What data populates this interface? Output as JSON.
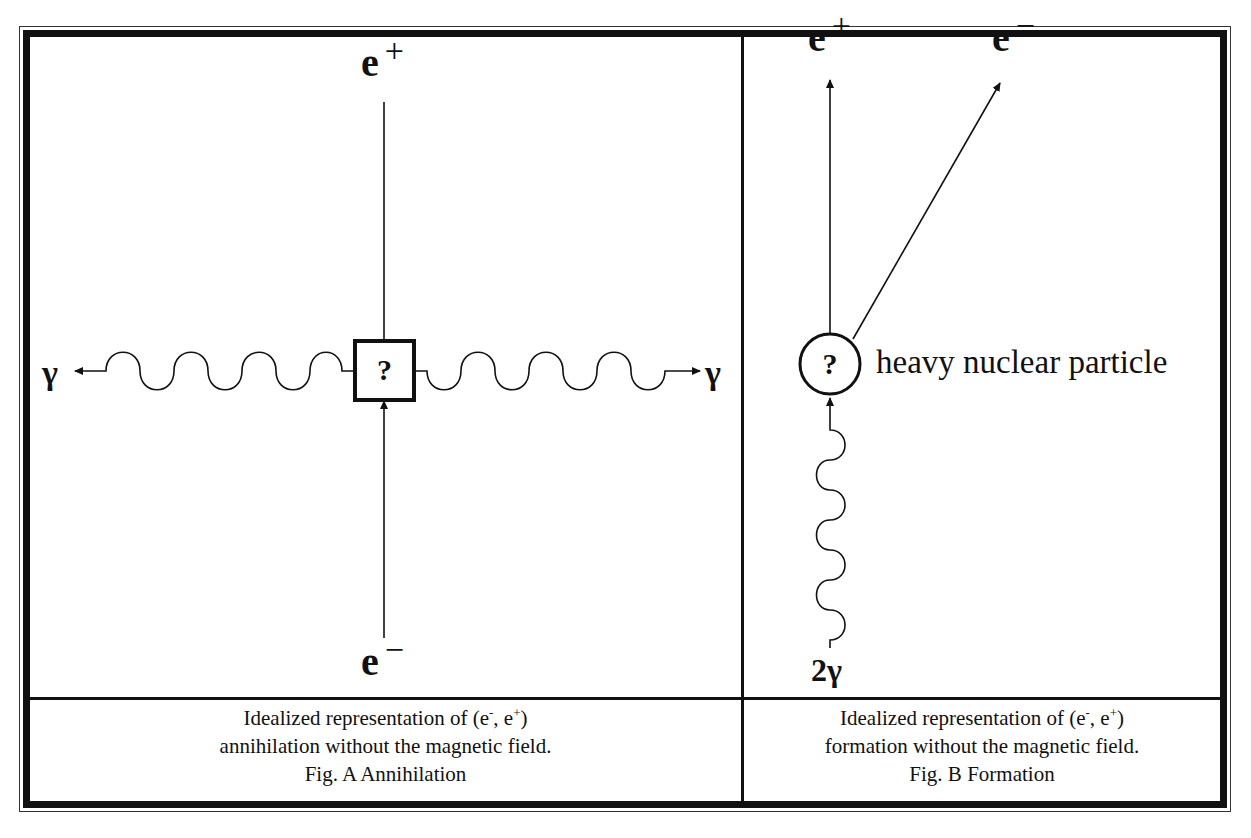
{
  "figure_a": {
    "labels": {
      "top": "e",
      "top_charge": "+",
      "bottom": "e",
      "bottom_charge": "−",
      "left": "γ",
      "right": "γ",
      "box": "?"
    },
    "caption": {
      "line1_prefix": "Idealized representation of (e",
      "line1_sup1": "-",
      "line1_mid": ", e",
      "line1_sup2": "+",
      "line1_suffix": ")",
      "line2": "annihilation without the magnetic field.",
      "title": "Fig. A Annihilation"
    }
  },
  "figure_b": {
    "labels": {
      "positron": "e",
      "positron_charge": "+",
      "electron": "e",
      "electron_charge": "−",
      "photon": "2γ",
      "circle": "?",
      "particle": "heavy nuclear particle"
    },
    "caption": {
      "line1_prefix": "Idealized representation of (e",
      "line1_sup1": "-",
      "line1_mid": ", e",
      "line1_sup2": "+",
      "line1_suffix": ")",
      "line2": "formation without the magnetic field.",
      "title": "Fig. B Formation"
    }
  },
  "colors": {
    "ink": "#111111",
    "background": "#ffffff"
  }
}
